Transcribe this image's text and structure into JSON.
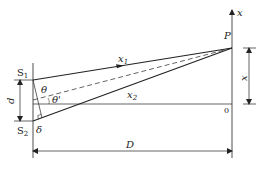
{
  "diagram": {
    "type": "double-slit interference geometry",
    "labels": {
      "axis_x": "x",
      "point_p": "P",
      "slit1": "S",
      "slit1_sub": "1",
      "slit2": "S",
      "slit2_sub": "2",
      "ray1": "x",
      "ray1_sub": "1",
      "ray2": "x",
      "ray2_sub": "2",
      "theta": "θ",
      "theta_prime": "θ'",
      "slit_separation": "d",
      "path_difference": "δ",
      "distance": "D",
      "position": "x",
      "origin": "0"
    },
    "colors": {
      "line": "#222222",
      "background": "#ffffff"
    }
  }
}
